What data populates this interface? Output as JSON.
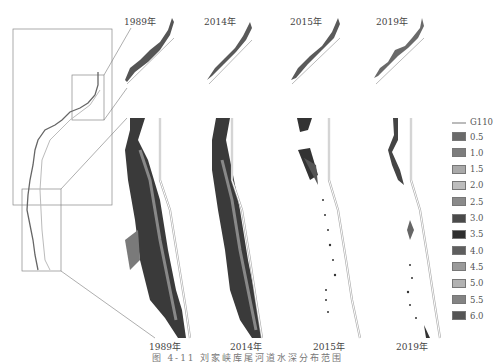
{
  "figure": {
    "caption": "图 4-11 刘家峡库尾河道水深分布范围",
    "top_row_labels": [
      "1989年",
      "2014年",
      "2015年",
      "2019年"
    ],
    "bottom_row_labels": [
      "1989年",
      "2014年",
      "2015年",
      "2019年"
    ]
  },
  "legend": {
    "road_label": "G110",
    "road_color": "#b8b8b8",
    "items": [
      {
        "label": "0.5",
        "color": "#6a6a6a"
      },
      {
        "label": "1.0",
        "color": "#7d7d7d"
      },
      {
        "label": "1.5",
        "color": "#a9a9a9"
      },
      {
        "label": "2.0",
        "color": "#bdbdbd"
      },
      {
        "label": "2.5",
        "color": "#8a8a8a"
      },
      {
        "label": "3.0",
        "color": "#4a4a4a"
      },
      {
        "label": "3.5",
        "color": "#2e2e2e"
      },
      {
        "label": "4.0",
        "color": "#5e5e5e"
      },
      {
        "label": "4.5",
        "color": "#9a9a9a"
      },
      {
        "label": "5.0",
        "color": "#b2b2b2"
      },
      {
        "label": "5.5",
        "color": "#838383"
      },
      {
        "label": "6.0",
        "color": "#555555"
      }
    ]
  }
}
